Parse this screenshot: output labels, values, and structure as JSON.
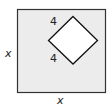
{
  "diagram": {
    "outer_square": {
      "side_label": "x",
      "fill": "#ececec",
      "stroke": "#333333"
    },
    "inner_square": {
      "side_label_top": "4",
      "side_label_bottom": "4",
      "fill": "#ffffff",
      "stroke": "#111111"
    },
    "labels": {
      "left": "x",
      "bottom": "x",
      "inner_top": "4",
      "inner_bottom": "4"
    }
  }
}
